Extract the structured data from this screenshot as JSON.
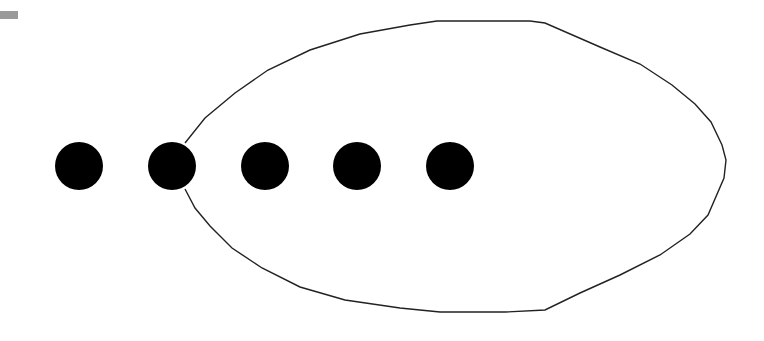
{
  "diagram": {
    "background": "#ffffff",
    "corner_marker": {
      "x": 0,
      "y": 11,
      "width": 18,
      "height": 8,
      "color": "#9a9a9a"
    },
    "dots": [
      {
        "cx": 79,
        "cy": 166,
        "r": 24
      },
      {
        "cx": 172,
        "cy": 166,
        "r": 24
      },
      {
        "cx": 265,
        "cy": 166,
        "r": 24
      },
      {
        "cx": 357,
        "cy": 166,
        "r": 24
      },
      {
        "cx": 450,
        "cy": 166,
        "r": 24
      }
    ],
    "dot_color": "#000000",
    "enclosure": {
      "stroke": "#222222",
      "stroke_width": 1.4,
      "points": [
        [
          185,
          143
        ],
        [
          205,
          118
        ],
        [
          235,
          93
        ],
        [
          268,
          70
        ],
        [
          310,
          50
        ],
        [
          360,
          34
        ],
        [
          410,
          25
        ],
        [
          437,
          21
        ],
        [
          530,
          21
        ],
        [
          545,
          23
        ],
        [
          600,
          47
        ],
        [
          640,
          64
        ],
        [
          672,
          85
        ],
        [
          695,
          104
        ],
        [
          711,
          122
        ],
        [
          722,
          145
        ],
        [
          726,
          160
        ],
        [
          724,
          178
        ],
        [
          708,
          215
        ],
        [
          690,
          234
        ],
        [
          660,
          255
        ],
        [
          620,
          275
        ],
        [
          580,
          293
        ],
        [
          545,
          310
        ],
        [
          505,
          312
        ],
        [
          440,
          312
        ],
        [
          400,
          308
        ],
        [
          345,
          300
        ],
        [
          300,
          287
        ],
        [
          262,
          268
        ],
        [
          232,
          248
        ],
        [
          210,
          226
        ],
        [
          195,
          208
        ],
        [
          185,
          189
        ]
      ]
    }
  }
}
